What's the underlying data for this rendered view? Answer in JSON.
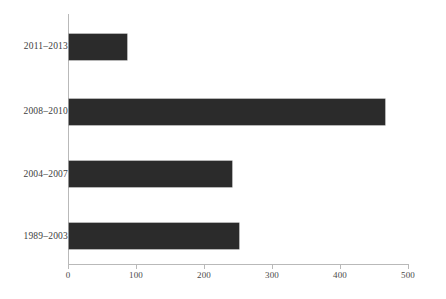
{
  "chart_data": {
    "type": "bar",
    "orientation": "horizontal",
    "title": "",
    "subtitle": "",
    "xlabel": "",
    "ylabel": "",
    "categories": [
      "2011–2013",
      "2008–2010",
      "2004–2007",
      "1989–2003"
    ],
    "values": [
      85,
      465,
      240,
      250
    ],
    "series": [
      {
        "name": "",
        "values": [
          85,
          465,
          240,
          250
        ]
      }
    ],
    "xlim": [
      0,
      500
    ],
    "xticks": [
      0,
      100,
      200,
      300,
      400,
      500
    ],
    "xtick_labels": [
      "0",
      "100",
      "200",
      "300",
      "400",
      "500"
    ],
    "grid": false,
    "legend": false,
    "legend_position": "none",
    "bar_color": "#2b2b2b",
    "axis_color": "#b9b9b9",
    "text_color": "#3d3d3d",
    "background_color": "#ffffff",
    "annotations": []
  }
}
